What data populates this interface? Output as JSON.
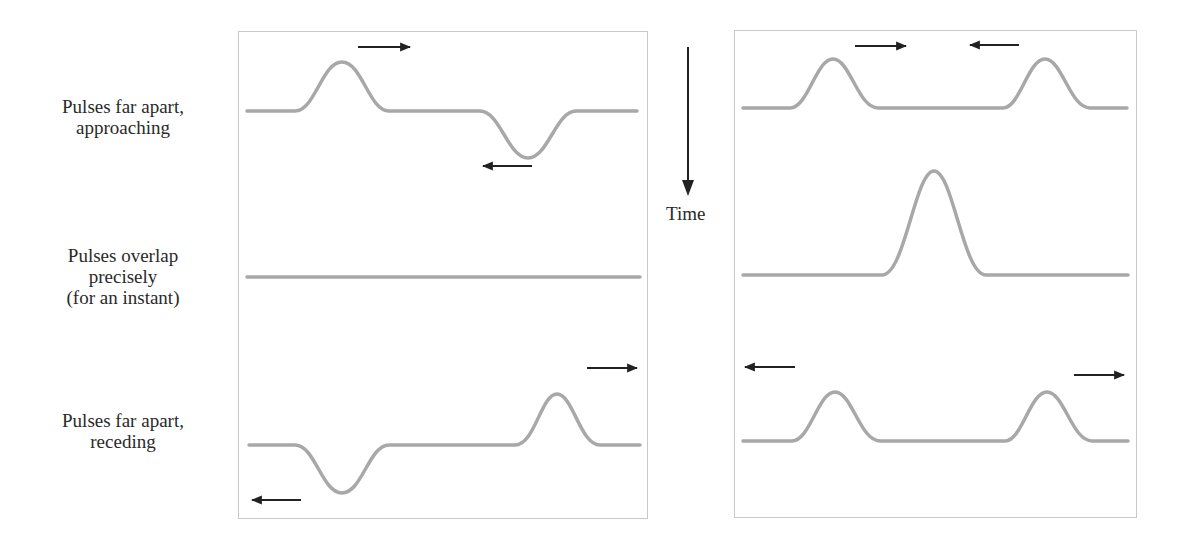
{
  "figure": {
    "time_axis": {
      "label": "Time",
      "direction": "down"
    },
    "rows": [
      {
        "label_lines": [
          "Pulses far apart,",
          "approaching"
        ]
      },
      {
        "label_lines": [
          "Pulses overlap",
          "precisely",
          "(for an instant)"
        ]
      },
      {
        "label_lines": [
          "Pulses far apart,",
          "receding"
        ]
      }
    ],
    "panels": [
      {
        "name": "destructive-interference",
        "rows": [
          {
            "pulses": [
              {
                "polarity": "up",
                "direction": "right"
              },
              {
                "polarity": "down",
                "direction": "left"
              }
            ]
          },
          {
            "pulses": [],
            "note": "flat line (pulses cancel)"
          },
          {
            "pulses": [
              {
                "polarity": "down",
                "direction": "left"
              },
              {
                "polarity": "up",
                "direction": "right"
              }
            ]
          }
        ]
      },
      {
        "name": "constructive-interference",
        "rows": [
          {
            "pulses": [
              {
                "polarity": "up",
                "direction": "right"
              },
              {
                "polarity": "up",
                "direction": "left"
              }
            ]
          },
          {
            "pulses": [
              {
                "polarity": "up",
                "amplitude": "double"
              }
            ]
          },
          {
            "pulses": [
              {
                "polarity": "up",
                "direction": "left"
              },
              {
                "polarity": "up",
                "direction": "right"
              }
            ]
          }
        ]
      }
    ],
    "colors": {
      "string": "#a8a8a8",
      "arrow": "#222222",
      "border": "#c9c9c9"
    }
  }
}
